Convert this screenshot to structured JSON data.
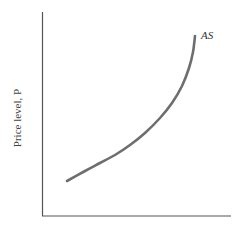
{
  "chart_data": {
    "type": "line",
    "title": "",
    "xlabel": "",
    "ylabel": "Price level, P",
    "grid": false,
    "legend": null,
    "series": [
      {
        "name": "AS",
        "description": "Aggregate supply curve: flat at low output, becoming steeper (nearly vertical) at high output",
        "points_px": [
          [
            67,
            181
          ],
          [
            85,
            171
          ],
          [
            100,
            163
          ],
          [
            115,
            155
          ],
          [
            130,
            145
          ],
          [
            145,
            133
          ],
          [
            160,
            118
          ],
          [
            172,
            103
          ],
          [
            182,
            86
          ],
          [
            189,
            68
          ],
          [
            193,
            52
          ],
          [
            195,
            36
          ]
        ]
      }
    ],
    "annotations": [
      {
        "text": "AS",
        "position": "top end of curve"
      }
    ],
    "axes": {
      "origin_px": [
        42,
        216
      ],
      "y_top_px": 12,
      "x_right_px": 231
    }
  },
  "labels": {
    "y_axis": "Price level, P",
    "curve": "AS"
  },
  "colors": {
    "axis": "#555555",
    "curve": "#6e6e6e",
    "text": "#444444"
  }
}
